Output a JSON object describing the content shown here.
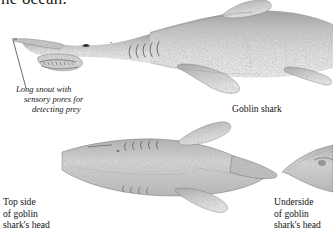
{
  "page": {
    "background_color": "#ffffff",
    "ink_color": "#1b1b1b"
  },
  "heading": {
    "text": "he ocean.",
    "note": "clipped bottom of a line of body text at the very top edge"
  },
  "callout": {
    "line1": "Long snout with",
    "line2": "sensory pores for",
    "line3": "detecting prey",
    "style": "italic",
    "leader_line": "thin diagonal rule from snout tip down to caption"
  },
  "labels": {
    "goblin_shark": "Goblin shark",
    "top_side": {
      "line1": "Top side",
      "line2": "of goblin",
      "line3": "shark's head"
    },
    "underside": {
      "line1": "Underside",
      "line2": "of goblin",
      "line3": "shark's head"
    }
  },
  "illustrations": [
    {
      "name": "goblin-shark-lateral",
      "view": "lateral full body, head at left, body continuing off right edge",
      "features": [
        "long flattened pointed snout",
        "protruding jaw with teeth",
        "small eye",
        "five gill slits",
        "dorsal fin",
        "pectoral fin",
        "pelvic fin"
      ],
      "tone": "grey stipple engraving"
    },
    {
      "name": "goblin-shark-head-topside",
      "view": "dorsal view of head, snout pointing right",
      "features": [
        "broad body",
        "two pectoral fins",
        "tapering snout"
      ],
      "tone": "grey stipple engraving"
    },
    {
      "name": "goblin-shark-head-underside",
      "view": "ventral view of head, clipped by right page edge",
      "features": [
        "tapering snout",
        "mouth"
      ],
      "tone": "grey stipple engraving"
    }
  ],
  "colors": {
    "ink": "#1b1b1b",
    "stipple_light": "#dcdcdc",
    "stipple_mid": "#b5b5b5",
    "stipple_dark": "#7d7d7d",
    "outline": "#5a5a5a"
  }
}
